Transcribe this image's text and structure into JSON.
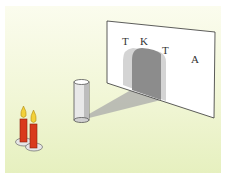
{
  "scene": {
    "description": "Candles casting shadow of cylinder onto screen",
    "screen_letters": [
      {
        "text": "T",
        "x": 126,
        "y": 46
      },
      {
        "text": "K",
        "x": 142,
        "y": 46
      },
      {
        "text": "T",
        "x": 163,
        "y": 54
      },
      {
        "text": "A",
        "x": 192,
        "y": 63
      }
    ],
    "colors": {
      "background": "#eef4cf",
      "candle": "#d93a1c",
      "flame": "#f2d13a",
      "shadow_dark": "#8f8f8f",
      "shadow_light": "#cfcfcf",
      "screen": "#ffffff"
    }
  }
}
